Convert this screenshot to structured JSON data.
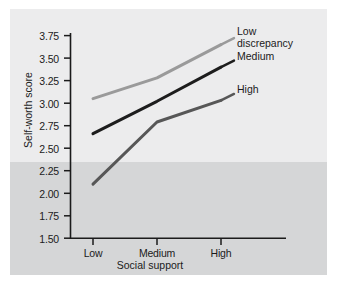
{
  "chart_data": {
    "type": "line",
    "title": "",
    "xlabel": "Social support",
    "ylabel": "Self-worth score",
    "categories": [
      "Low",
      "Medium",
      "High"
    ],
    "ylim": [
      1.5,
      3.75
    ],
    "ytick_labels": [
      "3.75",
      "3.50",
      "3.25",
      "3.00",
      "2.75",
      "2.50",
      "2.25",
      "2.00",
      "1.75",
      "1.50"
    ],
    "ytick_values": [
      3.75,
      3.5,
      3.25,
      3.0,
      2.75,
      2.5,
      2.25,
      2.0,
      1.75,
      1.5
    ],
    "ystep": 0.25,
    "grid": false,
    "legend_position": "right-inline",
    "series": [
      {
        "name": "Low\ndiscrepancy",
        "label_flat": "Low discrepancy",
        "values": [
          3.05,
          3.28,
          3.65
        ],
        "color": "#9a9a9a"
      },
      {
        "name": "Medium",
        "label_flat": "Medium",
        "values": [
          2.66,
          3.02,
          3.4
        ],
        "color": "#1d1d1d"
      },
      {
        "name": "High",
        "label_flat": "High",
        "values": [
          2.1,
          2.79,
          3.03
        ],
        "color": "#575757"
      }
    ]
  },
  "axes": {
    "ytick_0": "3.75",
    "ytick_1": "3.50",
    "ytick_2": "3.25",
    "ytick_3": "3.00",
    "ytick_4": "2.75",
    "ytick_5": "2.50",
    "ytick_6": "2.25",
    "ytick_7": "2.00",
    "ytick_8": "1.75",
    "ytick_9": "1.50",
    "xtick_0": "Low",
    "xtick_1": "Medium",
    "xtick_2": "High",
    "x_title": "Social support",
    "y_title": "Self-worth score"
  },
  "legend": {
    "low": "Low\ndiscrepancy",
    "medium": "Medium",
    "high": "High"
  },
  "colors": {
    "figure_background": "#ececed",
    "band_background": "#d5d6d7",
    "axis": "#1b1b1b",
    "text": "#1b1b1b",
    "series_low": "#9a9a9a",
    "series_medium": "#1d1d1d",
    "series_high": "#575757"
  }
}
